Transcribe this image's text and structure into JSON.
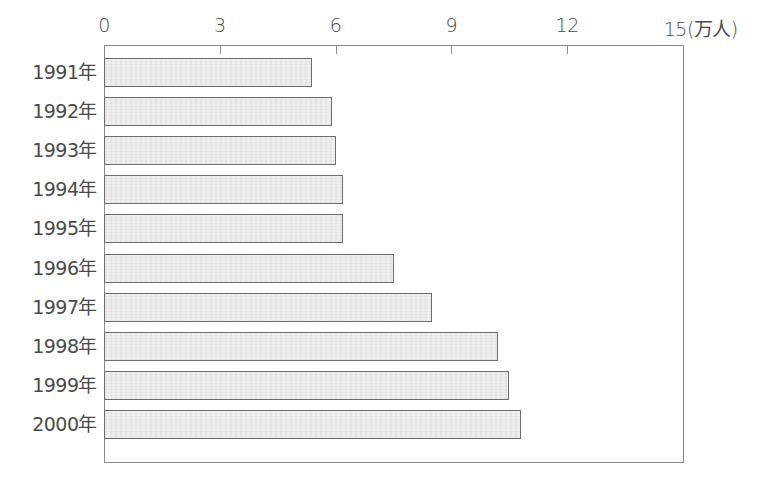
{
  "chart_data": {
    "type": "bar",
    "orientation": "horizontal",
    "title": "",
    "xlabel": "",
    "ylabel": "",
    "unit": "万人",
    "xlim": [
      0,
      15
    ],
    "x_ticks": [
      0,
      3,
      6,
      9,
      12,
      15
    ],
    "x_tick_labels": [
      "0",
      "3",
      "6",
      "9",
      "12",
      "15(万人)"
    ],
    "x_axis_position": "top",
    "grid": false,
    "legend": null,
    "categories": [
      "1991年",
      "1992年",
      "1993年",
      "1994年",
      "1995年",
      "1996年",
      "1997年",
      "1998年",
      "1999年",
      "2000年"
    ],
    "values": [
      5.4,
      5.9,
      6.0,
      6.2,
      6.2,
      7.5,
      8.5,
      10.2,
      10.5,
      10.8
    ],
    "colors": {
      "bar_fill": "#efefef",
      "bar_outline": "#6e6e6e",
      "frame": "#8a8a8a",
      "text": "#4a4a4a"
    }
  }
}
